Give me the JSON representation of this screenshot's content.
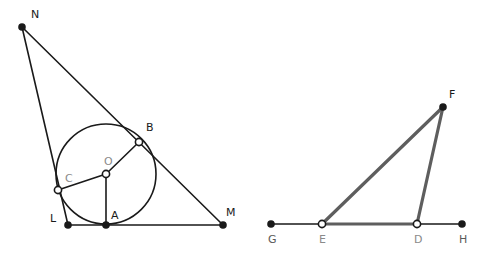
{
  "figure": {
    "background": "#ffffff",
    "colors": {
      "stroke_dark": "#1a1a1a",
      "stroke_gray": "#5e5e5e",
      "point_fill": "#1a1a1a",
      "point_hollow_fill": "#ffffff",
      "label_dark": "#1a1a1a",
      "label_gray": "#8a8a8a",
      "label_mid": "#5a5a5a"
    },
    "left_figure": {
      "name": "triangle-with-inscribed-circle",
      "points": [
        {
          "id": "N",
          "label": "N",
          "x": 22,
          "y": 27,
          "lx": 31,
          "ly": 18,
          "marker": "filled",
          "label_color": "label-dark"
        },
        {
          "id": "B",
          "label": "B",
          "x": 139,
          "y": 142,
          "lx": 146,
          "ly": 131,
          "marker": "hollow",
          "label_color": "label-dark"
        },
        {
          "id": "O",
          "label": "O",
          "x": 106,
          "y": 174,
          "lx": 104,
          "ly": 165,
          "marker": "hollow",
          "label_color": "label-gray"
        },
        {
          "id": "C",
          "label": "C",
          "x": 58,
          "y": 190,
          "lx": 65,
          "ly": 182,
          "marker": "hollow",
          "label_color": "label-gray"
        },
        {
          "id": "L",
          "label": "L",
          "x": 68,
          "y": 225,
          "lx": 50,
          "ly": 222,
          "marker": "filled",
          "label_color": "label-dark"
        },
        {
          "id": "A",
          "label": "A",
          "x": 106,
          "y": 225,
          "lx": 111,
          "ly": 219,
          "marker": "filled",
          "label_color": "label-dark"
        },
        {
          "id": "M",
          "label": "M",
          "x": 223,
          "y": 225,
          "lx": 226,
          "ly": 216,
          "marker": "filled",
          "label_color": "label-dark"
        }
      ],
      "circle": {
        "cx": 106,
        "cy": 174,
        "r": 50
      },
      "segments": [
        {
          "name": "segment-NL",
          "from": "N",
          "to": "L",
          "color": "#1a1a1a",
          "width": 1.6
        },
        {
          "name": "segment-NM",
          "from": "N",
          "to": "M",
          "color": "#1a1a1a",
          "width": 1.6
        },
        {
          "name": "segment-LM",
          "from": "L",
          "to": "M",
          "color": "#1a1a1a",
          "width": 1.6
        },
        {
          "name": "radius-OA",
          "from": "O",
          "to": "A",
          "color": "#1a1a1a",
          "width": 1.6
        },
        {
          "name": "radius-OB",
          "from": "O",
          "to": "B",
          "color": "#1a1a1a",
          "width": 1.6
        },
        {
          "name": "radius-OC",
          "from": "O",
          "to": "C",
          "color": "#1a1a1a",
          "width": 1.6
        }
      ]
    },
    "right_figure": {
      "name": "triangle-on-baseline",
      "points": [
        {
          "id": "F",
          "label": "F",
          "x": 443,
          "y": 107,
          "lx": 449,
          "ly": 98,
          "marker": "filled",
          "label_color": "label-dark"
        },
        {
          "id": "G",
          "label": "G",
          "x": 271,
          "y": 224,
          "lx": 268,
          "ly": 243,
          "marker": "filled",
          "label_color": "label-mid"
        },
        {
          "id": "E",
          "label": "E",
          "x": 322,
          "y": 224,
          "lx": 319,
          "ly": 243,
          "marker": "hollow",
          "label_color": "label-gray"
        },
        {
          "id": "D",
          "label": "D",
          "x": 417,
          "y": 224,
          "lx": 414,
          "ly": 243,
          "marker": "hollow",
          "label_color": "label-gray"
        },
        {
          "id": "H",
          "label": "H",
          "x": 462,
          "y": 224,
          "lx": 459,
          "ly": 243,
          "marker": "filled",
          "label_color": "label-mid"
        }
      ],
      "segments": [
        {
          "name": "segment-GE",
          "from": "G",
          "to": "E",
          "color": "#1a1a1a",
          "width": 1.6
        },
        {
          "name": "segment-DH",
          "from": "D",
          "to": "H",
          "color": "#1a1a1a",
          "width": 1.6
        },
        {
          "name": "segment-ED",
          "from": "E",
          "to": "D",
          "color": "#5e5e5e",
          "width": 3.2
        },
        {
          "name": "segment-EF",
          "from": "E",
          "to": "F",
          "color": "#5e5e5e",
          "width": 3.2
        },
        {
          "name": "segment-DF",
          "from": "D",
          "to": "F",
          "color": "#5e5e5e",
          "width": 3.2
        }
      ]
    }
  }
}
